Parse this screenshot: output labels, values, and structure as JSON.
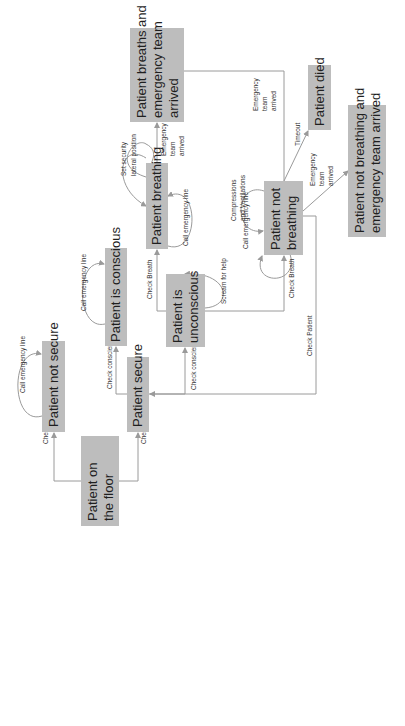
{
  "diagram": {
    "title": "",
    "colors": {
      "box_fill": "#bdbdbd",
      "edge": "#9a9a9a",
      "text": "#1f1f1f"
    },
    "nodes": [
      {
        "id": "floor",
        "lines": [
          "Patient on",
          "the floor"
        ]
      },
      {
        "id": "not_secure",
        "lines": [
          "Patient not secure"
        ]
      },
      {
        "id": "secure",
        "lines": [
          "Patient secure"
        ]
      },
      {
        "id": "conscious",
        "lines": [
          "Patient is conscious"
        ]
      },
      {
        "id": "unconscious",
        "lines": [
          "Patient is",
          "unconscious"
        ]
      },
      {
        "id": "breathing",
        "lines": [
          "Patient breathing"
        ]
      },
      {
        "id": "not_breathing",
        "lines": [
          "Patient not",
          "breathing"
        ]
      },
      {
        "id": "breaths_team",
        "lines": [
          "Patient breaths and",
          "emergency team",
          "arrived"
        ]
      },
      {
        "id": "died",
        "lines": [
          "Patient died"
        ]
      },
      {
        "id": "not_breathing_team",
        "lines": [
          "Patient not breathing and",
          "emergency team arrived"
        ]
      }
    ],
    "edges": [
      {
        "from": "floor",
        "to": "not_secure",
        "label": "Check Security"
      },
      {
        "from": "floor",
        "to": "secure",
        "label": "Check Security"
      },
      {
        "from": "not_secure",
        "to": "not_secure",
        "label": "Call emergency line"
      },
      {
        "from": "secure",
        "to": "conscious",
        "label": "Check conscience"
      },
      {
        "from": "secure",
        "to": "unconscious",
        "label": "Check conscience"
      },
      {
        "from": "conscious",
        "to": "conscious",
        "label": "Call emergency line"
      },
      {
        "from": "unconscious",
        "to": "unconscious",
        "label": "Scream for help"
      },
      {
        "from": "unconscious",
        "to": "breathing",
        "label": "Check Breath"
      },
      {
        "from": "unconscious",
        "to": "not_breathing",
        "label": "Check Breath"
      },
      {
        "from": "breathing",
        "to": "breathing",
        "label": "Set security lateral position",
        "label_lines": [
          "Set security",
          "lateral position"
        ]
      },
      {
        "from": "breathing",
        "to": "breathing",
        "label": "Call emergency line"
      },
      {
        "from": "breathing",
        "to": "breaths_team",
        "label": "Emergency team arrived",
        "label_lines": [
          "Emergency",
          "team",
          "arrived"
        ]
      },
      {
        "from": "not_breathing",
        "to": "not_breathing",
        "label": "Call emergency line"
      },
      {
        "from": "not_breathing",
        "to": "not_breathing",
        "label": "Compressions and Ventilations",
        "label_lines": [
          "Compressions",
          "and Ventilations"
        ]
      },
      {
        "from": "not_breathing",
        "to": "breaths_team",
        "label": "Emergency team arrived",
        "label_lines": [
          "Emergency",
          "team",
          "arrived"
        ]
      },
      {
        "from": "not_breathing",
        "to": "died",
        "label": "Timeout"
      },
      {
        "from": "not_breathing",
        "to": "not_breathing_team",
        "label": "Emergency team arrived",
        "label_lines": [
          "Emergency",
          "team",
          "arrived"
        ]
      },
      {
        "from": "not_breathing",
        "to": "secure",
        "label": "Check Patient"
      }
    ]
  }
}
